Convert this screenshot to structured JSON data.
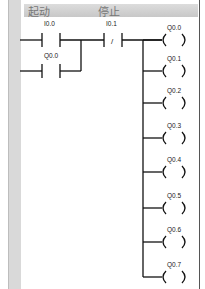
{
  "header": {
    "label_start": "起动",
    "label_stop": "停止"
  },
  "contacts": [
    {
      "id": "I0.0",
      "type": "NO"
    },
    {
      "id": "Q0.0",
      "type": "NO"
    },
    {
      "id": "I0.1",
      "type": "NC",
      "symbol": "/"
    }
  ],
  "coils": [
    "Q0.0",
    "Q0.1",
    "Q0.2",
    "Q0.3",
    "Q0.4",
    "Q0.5",
    "Q0.6",
    "Q0.7"
  ],
  "colors": {
    "line": "#111111",
    "rail": "#d9d9d9"
  }
}
